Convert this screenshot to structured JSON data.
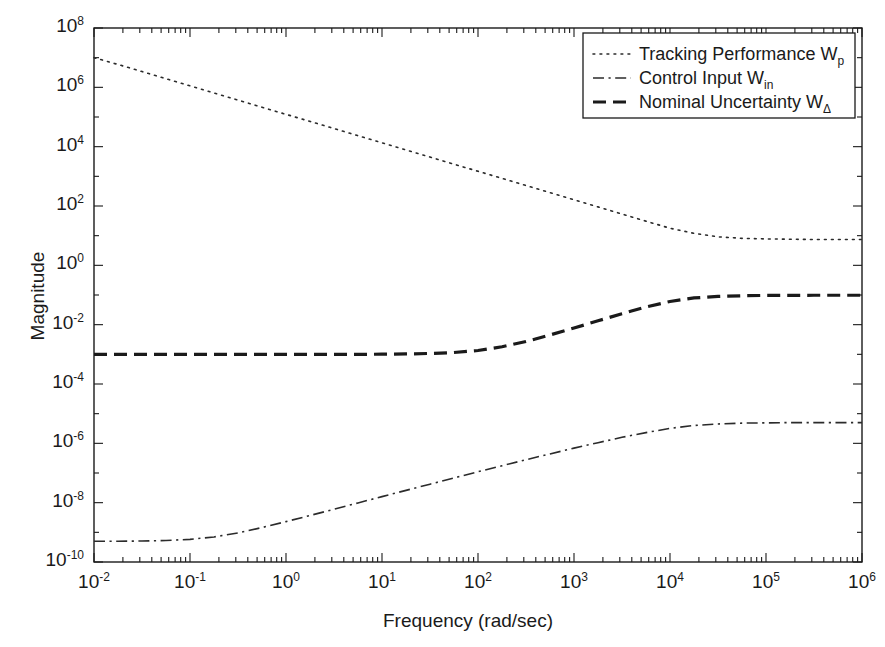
{
  "chart_data": {
    "type": "line",
    "title": "",
    "xlabel": "Frequency (rad/sec)",
    "ylabel": "Magnitude",
    "xscale": "log",
    "yscale": "log",
    "xlim": [
      0.01,
      1000000
    ],
    "ylim": [
      1e-10,
      100000000.0
    ],
    "grid": false,
    "legend_position": "upper right",
    "xticks": [
      "10^-2",
      "10^-1",
      "10^0",
      "10^1",
      "10^2",
      "10^3",
      "10^4",
      "10^5",
      "10^6"
    ],
    "xtick_exponents": [
      "-2",
      "-1",
      "0",
      "1",
      "2",
      "3",
      "4",
      "5",
      "6"
    ],
    "ytick_exponents": [
      "8",
      "6",
      "4",
      "2",
      "0",
      "-2",
      "-4",
      "-6",
      "-8",
      "-10"
    ],
    "series": [
      {
        "name": "Tracking Performance Wp",
        "legend_label": "Tracking Performance W",
        "legend_sub": "p",
        "linestyle": "dotted",
        "color": "#2b2b2b",
        "linewidth": 1.6,
        "x": [
          0.01,
          0.0178,
          0.0316,
          0.0562,
          0.1,
          0.178,
          0.316,
          0.562,
          1,
          1.78,
          3.16,
          5.62,
          10,
          17.8,
          31.6,
          56.2,
          100,
          178,
          316,
          562,
          1000,
          1780,
          3160,
          5620,
          10000,
          17800,
          31600,
          56200,
          100000,
          178000,
          316000,
          562000,
          1000000
        ],
        "y": [
          10000000,
          5890000,
          3390000,
          1950000,
          1120000,
          645000,
          372000,
          214000,
          123000,
          70800,
          40700,
          23400,
          13500,
          7760,
          4470,
          2570,
          1480,
          851,
          490,
          282,
          162,
          93.3,
          53.7,
          30.9,
          17.8,
          12.0,
          9.12,
          8.13,
          7.76,
          7.59,
          7.41,
          7.41,
          7.41
        ]
      },
      {
        "name": "Control Input Win",
        "legend_label": "Control Input W",
        "legend_sub": "in",
        "linestyle": "dashdot",
        "color": "#2b2b2b",
        "linewidth": 1.6,
        "x": [
          0.01,
          0.0178,
          0.0316,
          0.0562,
          0.1,
          0.178,
          0.316,
          0.562,
          1,
          1.78,
          3.16,
          5.62,
          10,
          17.8,
          31.6,
          56.2,
          100,
          178,
          316,
          562,
          1000,
          1780,
          3160,
          5620,
          10000,
          17800,
          31600,
          56200,
          100000,
          178000,
          316000,
          562000,
          1000000
        ],
        "y": [
          5e-10,
          5e-10,
          5.1e-10,
          5.3e-10,
          5.8e-10,
          7e-10,
          9.5e-10,
          1.45e-09,
          2.3e-09,
          3.7e-09,
          6e-09,
          9.8e-09,
          1.6e-08,
          2.6e-08,
          4.2e-08,
          6.8e-08,
          1.1e-07,
          1.75e-07,
          2.8e-07,
          4.4e-07,
          6.9e-07,
          1.05e-06,
          1.6e-06,
          2.3e-06,
          3.2e-06,
          4e-06,
          4.5e-06,
          4.8e-06,
          4.9e-06,
          5e-06,
          5e-06,
          5e-06,
          5e-06
        ]
      },
      {
        "name": "Nominal Uncertainty WDelta",
        "legend_label": "Nominal Uncertainty W",
        "legend_sub": "Δ",
        "linestyle": "dashed",
        "color": "#1a1a1a",
        "linewidth": 3.2,
        "x": [
          0.01,
          0.0178,
          0.0316,
          0.0562,
          0.1,
          0.178,
          0.316,
          0.562,
          1,
          1.78,
          3.16,
          5.62,
          10,
          17.8,
          31.6,
          56.2,
          100,
          178,
          316,
          562,
          1000,
          1780,
          3160,
          5620,
          10000,
          17800,
          31600,
          56200,
          100000,
          178000,
          316000,
          562000,
          1000000
        ],
        "y": [
          0.001,
          0.001,
          0.001,
          0.001,
          0.001,
          0.001,
          0.001,
          0.001,
          0.001,
          0.001,
          0.001,
          0.001,
          0.00101,
          0.00103,
          0.00107,
          0.00115,
          0.00135,
          0.0018,
          0.0027,
          0.0045,
          0.0077,
          0.0135,
          0.0235,
          0.0395,
          0.0605,
          0.0795,
          0.0895,
          0.0945,
          0.0965,
          0.0975,
          0.098,
          0.098,
          0.098
        ]
      }
    ]
  },
  "axes": {
    "ylabel": "Magnitude",
    "xlabel": "Frequency (rad/sec)"
  },
  "legend": {
    "items": [
      {
        "label": "Tracking Performance W",
        "sub": "p",
        "style": "dotted"
      },
      {
        "label": "Control Input W",
        "sub": "in",
        "style": "dashdot"
      },
      {
        "label": "Nominal Uncertainty W",
        "sub": "Δ",
        "style": "dashed"
      }
    ]
  },
  "colors": {
    "axis": "#1a1a1a",
    "curve": "#2b2b2b",
    "background": "#ffffff"
  }
}
